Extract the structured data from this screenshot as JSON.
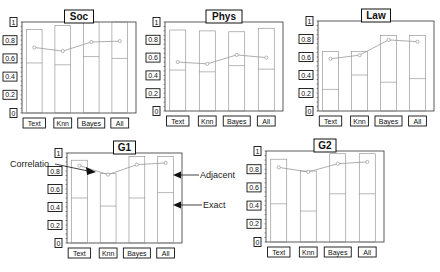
{
  "chart_data": [
    {
      "type": "bar",
      "title": "Soc",
      "categories": [
        "Text",
        "Knn",
        "Bayes",
        "All"
      ],
      "yticks": [
        "0",
        "0.2",
        "0.4",
        "0.6",
        "0.8",
        "1"
      ],
      "ylim": [
        0,
        1
      ],
      "series": [
        {
          "name": "Adjacent",
          "values": [
            0.92,
            0.96,
            1.0,
            1.0
          ]
        },
        {
          "name": "Exact",
          "values": [
            0.55,
            0.53,
            0.62,
            0.6
          ]
        },
        {
          "name": "Correlation",
          "type": "line",
          "values": [
            0.72,
            0.68,
            0.78,
            0.79
          ]
        }
      ],
      "box": {
        "left": 22,
        "top": 22,
        "right": 136,
        "bottom": 113
      }
    },
    {
      "type": "bar",
      "title": "Phys",
      "categories": [
        "Text",
        "Knn",
        "Bayes",
        "All"
      ],
      "yticks": [
        "0",
        "0.2",
        "0.4",
        "0.6",
        "0.8",
        "1"
      ],
      "ylim": [
        0,
        1
      ],
      "series": [
        {
          "name": "Adjacent",
          "values": [
            0.91,
            0.9,
            0.89,
            0.93
          ]
        },
        {
          "name": "Exact",
          "values": [
            0.46,
            0.44,
            0.51,
            0.47
          ]
        },
        {
          "name": "Correlation",
          "type": "line",
          "values": [
            0.55,
            0.53,
            0.63,
            0.6
          ]
        }
      ],
      "box": {
        "left": 165,
        "top": 22,
        "right": 283,
        "bottom": 111
      }
    },
    {
      "type": "bar",
      "title": "Law",
      "categories": [
        "Text",
        "Knn",
        "Bayes",
        "All"
      ],
      "yticks": [
        "0",
        "0.2",
        "0.4",
        "0.6",
        "0.8",
        "1"
      ],
      "ylim": [
        0,
        1
      ],
      "series": [
        {
          "name": "Adjacent",
          "values": [
            0.66,
            0.66,
            0.84,
            0.84
          ]
        },
        {
          "name": "Exact",
          "values": [
            0.24,
            0.4,
            0.32,
            0.36
          ]
        },
        {
          "name": "Correlation",
          "type": "line",
          "values": [
            0.58,
            0.62,
            0.79,
            0.77
          ]
        }
      ],
      "box": {
        "left": 318,
        "top": 21,
        "right": 434,
        "bottom": 111
      }
    },
    {
      "type": "bar",
      "title": "G1",
      "categories": [
        "Text",
        "Knn",
        "Bayes",
        "All"
      ],
      "yticks": [
        "0",
        "0.2",
        "0.4",
        "0.6",
        "0.8",
        "1"
      ],
      "ylim": [
        0,
        1
      ],
      "series": [
        {
          "name": "Adjacent",
          "values": [
            0.92,
            0.77,
            0.96,
            0.96
          ]
        },
        {
          "name": "Exact",
          "values": [
            0.5,
            0.41,
            0.5,
            0.56
          ]
        },
        {
          "name": "Correlation",
          "type": "line",
          "values": [
            0.86,
            0.76,
            0.87,
            0.89
          ]
        }
      ],
      "annotations": [
        {
          "text": "Correlatio",
          "target": "Correlation"
        },
        {
          "text": "Adjacent",
          "target": "Adjacent"
        },
        {
          "text": "Exact",
          "target": "Exact"
        }
      ],
      "box": {
        "left": 67,
        "top": 153,
        "right": 182,
        "bottom": 243
      }
    },
    {
      "type": "bar",
      "title": "G2",
      "categories": [
        "Text",
        "Knn",
        "Bayes",
        "All"
      ],
      "yticks": [
        "0",
        "0.2",
        "0.4",
        "0.6",
        "0.8",
        "1"
      ],
      "ylim": [
        0,
        1
      ],
      "series": [
        {
          "name": "Adjacent",
          "values": [
            0.91,
            0.78,
            0.97,
            0.97
          ]
        },
        {
          "name": "Exact",
          "values": [
            0.42,
            0.34,
            0.53,
            0.53
          ]
        },
        {
          "name": "Correlation",
          "type": "line",
          "values": [
            0.82,
            0.77,
            0.86,
            0.88
          ]
        }
      ],
      "box": {
        "left": 266,
        "top": 151,
        "right": 384,
        "bottom": 242
      }
    }
  ],
  "colors": {
    "axis": "#333333",
    "bar": "#888888",
    "line": "#999999",
    "text": "#111111"
  }
}
